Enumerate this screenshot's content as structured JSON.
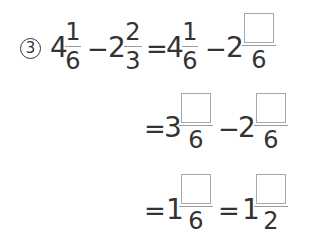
{
  "problem": {
    "number_label": "3",
    "line1": {
      "lhs": {
        "a_whole": "4",
        "a_num": "1",
        "a_den": "6",
        "minus": "−",
        "b_whole": "2",
        "b_num": "2",
        "b_den": "3"
      },
      "equals": "=",
      "rhs": {
        "a_whole": "4",
        "a_num": "1",
        "a_den": "6",
        "minus": "−",
        "b_whole": "2",
        "b_num_blank": "",
        "b_den": "6"
      }
    },
    "line2": {
      "equals": "=",
      "a_whole": "3",
      "a_num_blank": "",
      "a_den": "6",
      "minus": "−",
      "b_whole": "2",
      "b_num_blank": "",
      "b_den": "6"
    },
    "line3": {
      "equals1": "=",
      "a_whole": "1",
      "a_num_blank": "",
      "a_den": "6",
      "equals2": "=",
      "b_whole": "1",
      "b_num_blank": "",
      "b_den": "2"
    }
  },
  "colors": {
    "text": "#333333",
    "fraction_bar": "#9a9a9a",
    "blank_box_border": "#a8a8a8"
  }
}
